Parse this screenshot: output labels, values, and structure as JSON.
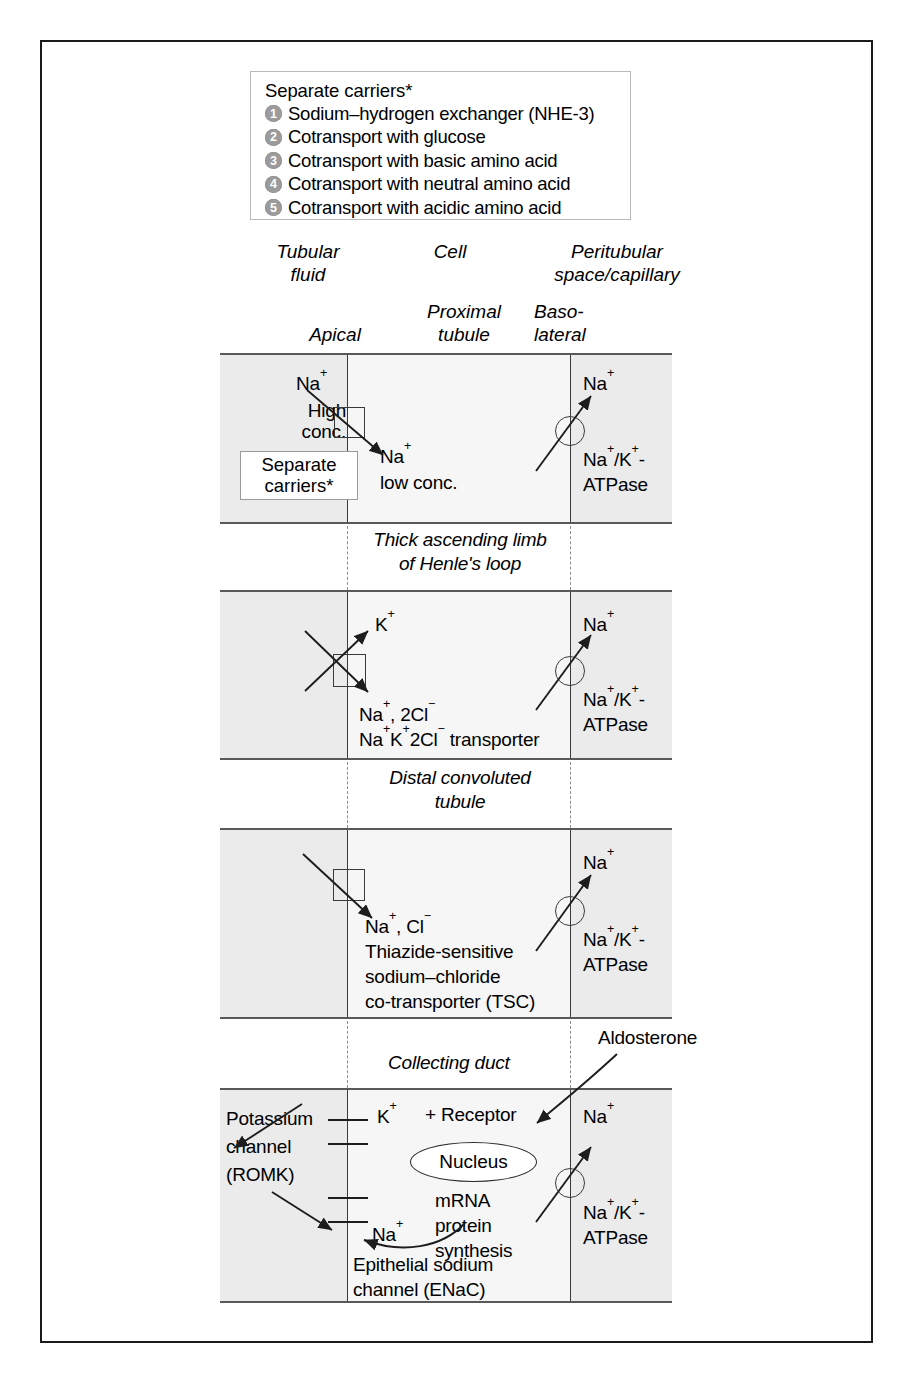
{
  "legend": {
    "title": "Separate carriers*",
    "items": [
      {
        "n": "1",
        "label": "Sodium–hydrogen exchanger (NHE-3)"
      },
      {
        "n": "2",
        "label": "Cotransport with glucose"
      },
      {
        "n": "3",
        "label": "Cotransport with basic amino acid"
      },
      {
        "n": "4",
        "label": "Cotransport with neutral amino acid"
      },
      {
        "n": "5",
        "label": "Cotransport with acidic amino acid"
      }
    ]
  },
  "headers": {
    "tubular_fluid": "Tubular\nfluid",
    "cell": "Cell",
    "peritubular": "Peritubular\nspace/capillary",
    "apical": "Apical",
    "proximal_tubule": "Proximal\ntubule",
    "basolateral": "Baso-\nlateral"
  },
  "panels": {
    "proximal": {
      "na_lumen": "Na",
      "na_lumen_sup": "+",
      "high_conc": "High\nconc.",
      "separate_carriers": "Separate\ncarriers*",
      "na_cell": "Na",
      "na_cell_sup": "+",
      "low_conc": "low conc.",
      "na_peri": "Na",
      "na_peri_sup": "+",
      "atpase_line1": "Na",
      "atpase_line2": "ATPase",
      "atpase_full": "Na+/K+-"
    },
    "tal": {
      "title": "Thick ascending limb\nof Henle's loop",
      "k_out": "K",
      "na2cl": "Na+, 2Cl−",
      "transporter": "Na+K+2Cl− transporter",
      "na_peri": "Na",
      "atpase_line2": "ATPase"
    },
    "dct": {
      "title": "Distal convoluted\ntubule",
      "nacl": "Na+, Cl−",
      "name_line1": "Thiazide-sensitive",
      "name_line2": "sodium–chloride",
      "name_line3": "co-transporter (TSC)",
      "na_peri": "Na",
      "atpase_line2": "ATPase"
    },
    "collecting": {
      "title": "Collecting duct",
      "aldosterone": "Aldosterone",
      "potassium_channel": "Potassium\nchannel\n(ROMK)",
      "k_ion": "K",
      "plus_receptor": "+ Receptor",
      "nucleus": "Nucleus",
      "mrna": "mRNA",
      "protein": "protein",
      "synthesis": "synthesis",
      "na_apical": "Na",
      "enac_line1": "Epithelial sodium",
      "enac_line2": "channel (ENaC)",
      "na_peri": "Na",
      "atpase_line2": "ATPase"
    }
  },
  "colors": {
    "panel_fill": "#ebebeb",
    "cell_fill": "#f6f6f6",
    "membrane": "#3a3a3a",
    "badge": "#9b9b9b",
    "frame": "#1a1a1a"
  }
}
